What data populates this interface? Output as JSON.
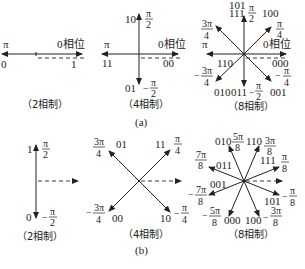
{
  "figure": {
    "part_a": {
      "label": "(a)",
      "two_phase": {
        "caption": "（2相制）",
        "ref_label": "0相位",
        "vectors": [
          {
            "code": "0",
            "phase": "π"
          },
          {
            "code": "1",
            "phase": "0"
          }
        ],
        "pi": "π"
      },
      "four_phase": {
        "caption": "（4相制）",
        "ref_label": "0相位",
        "vectors": [
          {
            "code": "00",
            "phase": "0"
          },
          {
            "code": "10",
            "phase_num": "π",
            "phase_den": "2",
            "sign": ""
          },
          {
            "code": "11",
            "phase": "π"
          },
          {
            "code": "01",
            "phase_num": "π",
            "phase_den": "2",
            "sign": "−"
          }
        ],
        "pi": "π"
      },
      "eight_phase": {
        "caption": "（8相制）",
        "ref_label": "0相位",
        "vectors": [
          {
            "code": "000",
            "phase": "0"
          },
          {
            "code": "100",
            "phase_num": "π",
            "phase_den": "4",
            "sign": ""
          },
          {
            "code": "101",
            "phase_num": "π",
            "phase_den": "2",
            "sign": ""
          },
          {
            "code": "111",
            "phase_num": "3π",
            "phase_den": "4",
            "sign": ""
          },
          {
            "code": "110",
            "phase": "π"
          },
          {
            "code": "010",
            "phase_num": "3π",
            "phase_den": "4",
            "sign": "−"
          },
          {
            "code": "011",
            "phase_num": "π",
            "phase_den": "2",
            "sign": "−"
          },
          {
            "code": "001",
            "phase_num": "π",
            "phase_den": "4",
            "sign": "−"
          }
        ],
        "pi": "π"
      }
    },
    "part_b": {
      "label": "(b)",
      "two_phase": {
        "caption": "（2相制）",
        "vectors": [
          {
            "code": "1",
            "phase_num": "π",
            "phase_den": "2",
            "sign": ""
          },
          {
            "code": "0",
            "phase_num": "π",
            "phase_den": "2",
            "sign": "−"
          }
        ]
      },
      "four_phase": {
        "caption": "（4相制）",
        "vectors": [
          {
            "code": "11",
            "phase_num": "π",
            "phase_den": "4",
            "sign": ""
          },
          {
            "code": "01",
            "phase_num": "3π",
            "phase_den": "4",
            "sign": ""
          },
          {
            "code": "00",
            "phase_num": "3π",
            "phase_den": "4",
            "sign": "−"
          },
          {
            "code": "10",
            "phase_num": "π",
            "phase_den": "4",
            "sign": "−"
          }
        ]
      },
      "eight_phase": {
        "caption": "（8相制）",
        "vectors": [
          {
            "code": "111",
            "phase_num": "π",
            "phase_den": "8",
            "sign": ""
          },
          {
            "code": "110",
            "phase_num": "3π",
            "phase_den": "8",
            "sign": ""
          },
          {
            "code": "010",
            "phase_num": "5π",
            "phase_den": "8",
            "sign": ""
          },
          {
            "code": "011",
            "phase_num": "7π",
            "phase_den": "8",
            "sign": ""
          },
          {
            "code": "001",
            "phase_num": "7π",
            "phase_den": "8",
            "sign": "−"
          },
          {
            "code": "000",
            "phase_num": "5π",
            "phase_den": "8",
            "sign": "−"
          },
          {
            "code": "100",
            "phase_num": "3π",
            "phase_den": "8",
            "sign": "−"
          },
          {
            "code": "101",
            "phase_num": "π",
            "phase_den": "8",
            "sign": "−"
          }
        ]
      }
    }
  }
}
